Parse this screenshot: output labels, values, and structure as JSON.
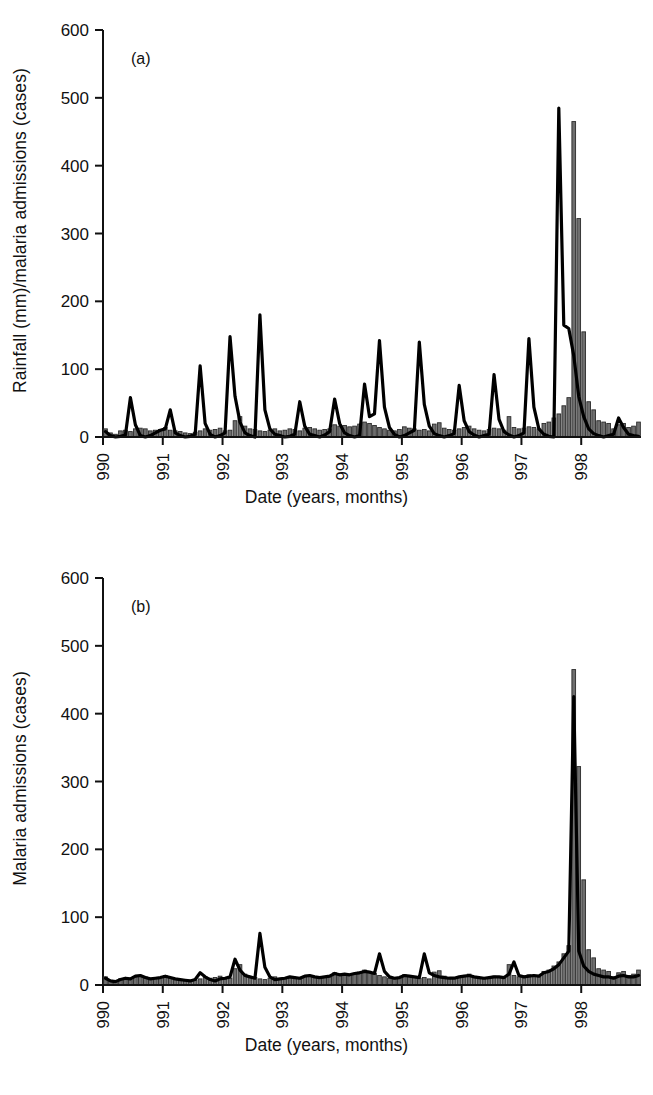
{
  "figure": {
    "width": 653,
    "height": 1095,
    "background": "#ffffff",
    "ink_color": "#111111",
    "bar_fill": "#6e6e6e",
    "bar_stroke": "#2b2b2b",
    "line_color": "#000000"
  },
  "panels": [
    {
      "tag": "(a)",
      "ylabel": "Rainfall (mm)/malaria admissions (cases)",
      "xlabel": "Date (years, months)"
    },
    {
      "tag": "(b)",
      "ylabel": "Malaria admissions (cases)",
      "xlabel": "Date (years, months)"
    }
  ],
  "axis": {
    "y_ticks": [
      "0",
      "100",
      "200",
      "300",
      "400",
      "500",
      "600"
    ],
    "y_tick_values": [
      0,
      100,
      200,
      300,
      400,
      500,
      600
    ],
    "x_ticks": [
      "1990",
      "1991",
      "1992",
      "1993",
      "1994",
      "1995",
      "1996",
      "1997",
      "1998"
    ],
    "x_tick_values": [
      1990,
      1991,
      1992,
      1993,
      1994,
      1995,
      1996,
      1997,
      1998
    ],
    "ylim": [
      0,
      600
    ],
    "xlim": [
      1990.0,
      1998.92
    ],
    "grid": false,
    "legend": "none"
  },
  "chart_data": [
    {
      "id": "panel-a",
      "type": "bar",
      "title": "(a)",
      "xlabel": "Date (years, months)",
      "ylabel": "Rainfall (mm)/malaria admissions (cases)",
      "ylim": [
        0,
        600
      ],
      "xlim": [
        1990.0,
        1998.92
      ],
      "grid": false,
      "legend_position": "none",
      "x_start": 1990.0,
      "x_step_months": 1,
      "series": [
        {
          "name": "Malaria admissions (cases)",
          "render": "bar",
          "color": "#6e6e6e",
          "values": [
            12,
            6,
            4,
            9,
            10,
            8,
            12,
            13,
            12,
            9,
            10,
            11,
            14,
            10,
            9,
            8,
            6,
            5,
            7,
            9,
            12,
            10,
            11,
            13,
            9,
            10,
            24,
            30,
            16,
            12,
            11,
            9,
            8,
            10,
            12,
            9,
            10,
            12,
            11,
            9,
            13,
            14,
            12,
            10,
            11,
            12,
            18,
            16,
            17,
            15,
            16,
            19,
            22,
            20,
            17,
            14,
            12,
            10,
            9,
            11,
            15,
            13,
            12,
            10,
            11,
            9,
            19,
            21,
            13,
            11,
            10,
            12,
            14,
            16,
            12,
            10,
            9,
            11,
            13,
            12,
            10,
            30,
            14,
            12,
            13,
            15,
            14,
            12,
            20,
            22,
            28,
            34,
            46,
            58,
            465,
            322,
            155,
            52,
            40,
            24,
            22,
            20,
            12,
            18,
            20,
            14,
            16,
            22
          ]
        },
        {
          "name": "Rainfall (mm)",
          "render": "line",
          "color": "#000000",
          "values": [
            8,
            2,
            0,
            1,
            3,
            58,
            18,
            2,
            0,
            2,
            6,
            10,
            12,
            40,
            6,
            2,
            0,
            1,
            4,
            105,
            20,
            4,
            0,
            2,
            6,
            148,
            60,
            22,
            6,
            2,
            0,
            180,
            40,
            12,
            4,
            2,
            0,
            1,
            4,
            52,
            16,
            4,
            2,
            0,
            3,
            8,
            56,
            20,
            6,
            2,
            0,
            2,
            78,
            30,
            34,
            142,
            44,
            14,
            4,
            0,
            2,
            6,
            10,
            140,
            48,
            16,
            5,
            2,
            0,
            2,
            5,
            76,
            24,
            8,
            3,
            0,
            2,
            4,
            92,
            26,
            8,
            3,
            0,
            2,
            6,
            145,
            44,
            12,
            4,
            1,
            0,
            485,
            165,
            160,
            120,
            60,
            30,
            12,
            5,
            2,
            0,
            2,
            4,
            28,
            14,
            4,
            2,
            1
          ]
        }
      ]
    },
    {
      "id": "panel-b",
      "type": "bar",
      "title": "(b)",
      "xlabel": "Date (years, months)",
      "ylabel": "Malaria admissions (cases)",
      "ylim": [
        0,
        600
      ],
      "xlim": [
        1990.0,
        1998.92
      ],
      "grid": false,
      "legend_position": "none",
      "x_start": 1990.0,
      "x_step_months": 1,
      "series": [
        {
          "name": "Malaria admissions (cases)",
          "render": "bar",
          "color": "#6e6e6e",
          "values": [
            12,
            6,
            4,
            9,
            10,
            8,
            12,
            13,
            12,
            9,
            10,
            11,
            14,
            10,
            9,
            8,
            6,
            5,
            7,
            9,
            12,
            10,
            11,
            13,
            9,
            10,
            24,
            30,
            16,
            12,
            11,
            9,
            8,
            10,
            12,
            9,
            10,
            12,
            11,
            9,
            13,
            14,
            12,
            10,
            11,
            12,
            18,
            16,
            17,
            15,
            16,
            19,
            22,
            20,
            17,
            14,
            12,
            10,
            9,
            11,
            15,
            13,
            12,
            10,
            11,
            9,
            19,
            21,
            13,
            11,
            10,
            12,
            14,
            16,
            12,
            10,
            9,
            11,
            13,
            12,
            10,
            30,
            14,
            12,
            13,
            15,
            14,
            12,
            20,
            22,
            28,
            34,
            46,
            58,
            465,
            322,
            155,
            52,
            40,
            24,
            22,
            20,
            12,
            18,
            20,
            14,
            16,
            22
          ]
        },
        {
          "name": "Modelled admissions (cases)",
          "render": "line",
          "color": "#000000",
          "values": [
            10,
            6,
            5,
            8,
            10,
            9,
            13,
            14,
            11,
            9,
            10,
            11,
            13,
            11,
            9,
            8,
            7,
            6,
            8,
            18,
            12,
            8,
            6,
            9,
            10,
            12,
            38,
            22,
            14,
            12,
            10,
            76,
            26,
            12,
            8,
            9,
            10,
            12,
            11,
            10,
            13,
            14,
            12,
            11,
            12,
            13,
            17,
            15,
            16,
            15,
            17,
            18,
            20,
            19,
            17,
            46,
            20,
            12,
            10,
            11,
            14,
            13,
            12,
            11,
            46,
            18,
            14,
            12,
            11,
            10,
            10,
            12,
            13,
            14,
            12,
            11,
            10,
            11,
            12,
            12,
            11,
            16,
            34,
            14,
            12,
            13,
            14,
            13,
            18,
            20,
            24,
            30,
            40,
            50,
            425,
            50,
            28,
            20,
            16,
            14,
            12,
            12,
            10,
            13,
            14,
            12,
            12,
            14
          ]
        }
      ]
    }
  ]
}
